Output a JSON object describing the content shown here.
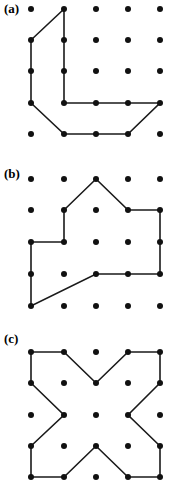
{
  "figure": {
    "width": 178,
    "height": 491,
    "background_color": "#ffffff",
    "ink_color": "#1a1a1a",
    "dot_color": "#111111",
    "type": "lattice-polygon-diagram"
  },
  "panels": [
    {
      "id": "panel-a",
      "label": "(a)",
      "grid": {
        "columns": 5,
        "rows": 5,
        "x_positions": [
          31,
          64,
          96,
          128,
          160
        ],
        "y_positions": [
          9,
          40,
          71,
          103,
          134
        ],
        "dot_radius": 3
      },
      "polygon": {
        "closed": true,
        "vertex_cells": [
          [
            2,
            1
          ],
          [
            1,
            2
          ],
          [
            1,
            4
          ],
          [
            2,
            5
          ],
          [
            4,
            5
          ],
          [
            5,
            4
          ],
          [
            2,
            4
          ]
        ],
        "vertex_points": [
          [
            64,
            9
          ],
          [
            31,
            40
          ],
          [
            31,
            103
          ],
          [
            64,
            134
          ],
          [
            128,
            134
          ],
          [
            160,
            103
          ],
          [
            64,
            103
          ]
        ],
        "vertex_count": 7
      }
    },
    {
      "id": "panel-b",
      "label": "(b)",
      "grid": {
        "columns": 5,
        "rows": 5,
        "x_positions": [
          31,
          64,
          96,
          128,
          160
        ],
        "y_positions": [
          179,
          210,
          242,
          274,
          306
        ],
        "dot_radius": 3
      },
      "polygon": {
        "closed": true,
        "vertex_cells": [
          [
            3,
            1
          ],
          [
            4,
            2
          ],
          [
            5,
            2
          ],
          [
            5,
            4
          ],
          [
            3,
            4
          ],
          [
            1,
            5
          ],
          [
            1,
            3
          ],
          [
            2,
            3
          ],
          [
            2,
            2
          ]
        ],
        "vertex_points": [
          [
            96,
            179
          ],
          [
            128,
            210
          ],
          [
            160,
            210
          ],
          [
            160,
            274
          ],
          [
            96,
            274
          ],
          [
            31,
            306
          ],
          [
            31,
            242
          ],
          [
            64,
            242
          ],
          [
            64,
            210
          ]
        ],
        "vertex_count": 9
      }
    },
    {
      "id": "panel-c",
      "label": "(c)",
      "grid": {
        "columns": 5,
        "rows": 5,
        "x_positions": [
          31,
          64,
          96,
          128,
          160
        ],
        "y_positions": [
          352,
          383,
          415,
          446,
          477
        ],
        "dot_radius": 3
      },
      "polygon": {
        "closed": true,
        "shape_name": "cross",
        "vertex_cells": [
          [
            1,
            1
          ],
          [
            2,
            1
          ],
          [
            3,
            2
          ],
          [
            4,
            1
          ],
          [
            5,
            1
          ],
          [
            5,
            2
          ],
          [
            4,
            3
          ],
          [
            5,
            4
          ],
          [
            5,
            5
          ],
          [
            4,
            5
          ],
          [
            3,
            4
          ],
          [
            2,
            5
          ],
          [
            1,
            5
          ],
          [
            1,
            4
          ],
          [
            2,
            3
          ],
          [
            1,
            2
          ]
        ],
        "vertex_points": [
          [
            31,
            352
          ],
          [
            64,
            352
          ],
          [
            96,
            383
          ],
          [
            128,
            352
          ],
          [
            160,
            352
          ],
          [
            160,
            383
          ],
          [
            128,
            415
          ],
          [
            160,
            446
          ],
          [
            160,
            477
          ],
          [
            128,
            477
          ],
          [
            96,
            446
          ],
          [
            64,
            477
          ],
          [
            31,
            477
          ],
          [
            31,
            446
          ],
          [
            64,
            415
          ],
          [
            31,
            383
          ]
        ],
        "vertex_count": 16
      }
    }
  ]
}
